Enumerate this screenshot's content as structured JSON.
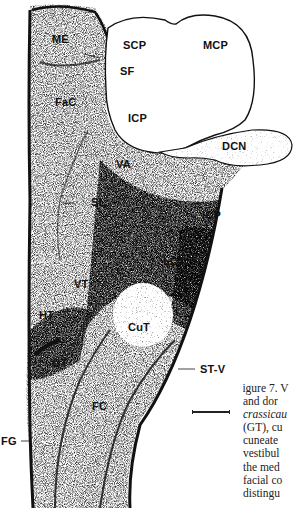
{
  "figure": {
    "labels": {
      "ME": "ME",
      "SCP": "SCP",
      "MCP": "MCP",
      "SF": "SF",
      "FaC": "FaC",
      "ICP_top": "ICP",
      "DCN": "DCN",
      "VA": "VA",
      "SL": "SL",
      "ICP_side": "ICP",
      "LCT": "LCT",
      "VT": "VT",
      "HT": "HT",
      "CuT": "CuT",
      "GT": "GT",
      "ST_V": "ST-V",
      "FC": "FC",
      "FG": "FG"
    },
    "caption_lines": [
      "Figure 7. V",
      "and dor",
      "crassicau",
      "(GT), cu",
      "cuneate",
      "vestibul",
      "the med",
      "facial co",
      "distingu"
    ],
    "colors": {
      "ink": "#111111",
      "paper": "#ffffff"
    }
  }
}
